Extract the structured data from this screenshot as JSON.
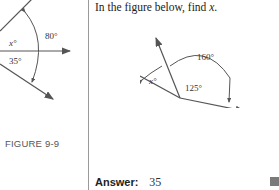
{
  "left_figure": {
    "caption": "FIGURE 9-9",
    "labels": {
      "x": "x°",
      "angle_a": "80°",
      "angle_b": "35°"
    }
  },
  "problem": {
    "prompt_prefix": "In the figure below, find ",
    "prompt_var": "x",
    "prompt_suffix": ".",
    "figure": {
      "labels": {
        "x": "x°",
        "angle_a": "160°",
        "angle_b": "125°"
      }
    }
  },
  "answer": {
    "label": "Answer:",
    "value": "35"
  },
  "colors": {
    "line": "#555555",
    "divider": "#9a9a9a",
    "end_mark": "#7a7a7a"
  }
}
